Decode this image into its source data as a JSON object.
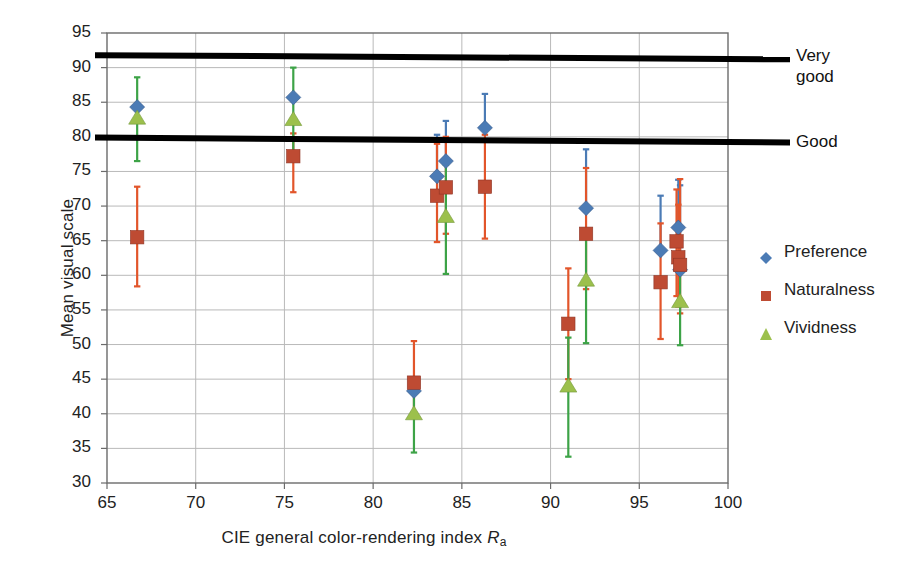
{
  "chart_data": {
    "type": "scatter",
    "title": "",
    "xlabel": "CIE general color-rendering index R_a",
    "xlabel_parts": {
      "main": "CIE general color-rendering index ",
      "italic": "R",
      "sub": "a"
    },
    "ylabel": "Mean visual scale",
    "xlim": [
      65,
      100
    ],
    "ylim": [
      30,
      95
    ],
    "xticks": [
      65,
      70,
      75,
      80,
      85,
      90,
      95,
      100
    ],
    "yticks": [
      30,
      35,
      40,
      45,
      50,
      55,
      60,
      65,
      70,
      75,
      80,
      85,
      90,
      95
    ],
    "grid": true,
    "legend_position": "right",
    "series": [
      {
        "name": "Preference",
        "marker": "diamond",
        "color": "#4B7BB5",
        "errorbar_color": "#4B7BB5",
        "points": [
          {
            "x": 66.7,
            "y": 84.3,
            "ylow": 84.3,
            "yhigh": 84.3
          },
          {
            "x": 75.5,
            "y": 85.7,
            "ylow": 85.7,
            "yhigh": 85.7
          },
          {
            "x": 82.3,
            "y": 43.3,
            "ylow": 43.3,
            "yhigh": 43.3
          },
          {
            "x": 83.6,
            "y": 74.3,
            "ylow": 74.3,
            "yhigh": 80.3
          },
          {
            "x": 84.1,
            "y": 76.5,
            "ylow": 76.5,
            "yhigh": 82.3
          },
          {
            "x": 86.3,
            "y": 81.3,
            "ylow": 81.3,
            "yhigh": 86.2
          },
          {
            "x": 92.0,
            "y": 69.7,
            "ylow": 69.7,
            "yhigh": 78.2
          },
          {
            "x": 96.2,
            "y": 63.6,
            "ylow": 63.6,
            "yhigh": 71.5
          },
          {
            "x": 97.2,
            "y": 66.9,
            "ylow": 66.9,
            "yhigh": 73.8
          },
          {
            "x": 97.3,
            "y": 60.8,
            "ylow": 60.8,
            "yhigh": 73.0
          }
        ]
      },
      {
        "name": "Naturalness",
        "marker": "square",
        "color": "#BE4B33",
        "errorbar_color": "#E2552A",
        "points": [
          {
            "x": 66.7,
            "y": 65.5,
            "ylow": 58.4,
            "yhigh": 72.8
          },
          {
            "x": 75.5,
            "y": 77.2,
            "ylow": 72.0,
            "yhigh": 80.5
          },
          {
            "x": 82.3,
            "y": 44.5,
            "ylow": 40.0,
            "yhigh": 50.5
          },
          {
            "x": 83.6,
            "y": 71.5,
            "ylow": 64.8,
            "yhigh": 79.0
          },
          {
            "x": 84.1,
            "y": 72.7,
            "ylow": 66.0,
            "yhigh": 80.0
          },
          {
            "x": 86.3,
            "y": 72.8,
            "ylow": 65.3,
            "yhigh": 80.3
          },
          {
            "x": 91.0,
            "y": 53.0,
            "ylow": 45.0,
            "yhigh": 61.0
          },
          {
            "x": 92.0,
            "y": 66.0,
            "ylow": 58.0,
            "yhigh": 75.5
          },
          {
            "x": 96.2,
            "y": 59.0,
            "ylow": 50.8,
            "yhigh": 67.5
          },
          {
            "x": 97.1,
            "y": 64.9,
            "ylow": 57.0,
            "yhigh": 72.4
          },
          {
            "x": 97.2,
            "y": 62.6,
            "ylow": 55.5,
            "yhigh": 70.2
          },
          {
            "x": 97.3,
            "y": 61.5,
            "ylow": 54.5,
            "yhigh": 73.9
          }
        ]
      },
      {
        "name": "Vividness",
        "marker": "triangle",
        "color": "#9CC04C",
        "errorbar_color": "#3DA347",
        "points": [
          {
            "x": 66.7,
            "y": 82.7,
            "ylow": 76.5,
            "yhigh": 88.6
          },
          {
            "x": 75.5,
            "y": 82.5,
            "ylow": 77.2,
            "yhigh": 90.0
          },
          {
            "x": 82.3,
            "y": 40.0,
            "ylow": 34.4,
            "yhigh": 45.0
          },
          {
            "x": 84.1,
            "y": 68.5,
            "ylow": 60.2,
            "yhigh": 76.0
          },
          {
            "x": 91.0,
            "y": 44.0,
            "ylow": 33.8,
            "yhigh": 51.0
          },
          {
            "x": 92.0,
            "y": 59.3,
            "ylow": 50.2,
            "yhigh": 66.0
          },
          {
            "x": 97.3,
            "y": 56.2,
            "ylow": 49.9,
            "yhigh": 63.0
          }
        ]
      }
    ],
    "reference_lines": [
      {
        "label": "Very\ngood",
        "y_left": 91.8,
        "y_right": 91.2
      },
      {
        "label": "Good",
        "y_left": 79.9,
        "y_right": 79.2
      }
    ]
  },
  "legend": {
    "items": [
      {
        "label": "Preference",
        "marker": "diamond",
        "color": "#4B7BB5"
      },
      {
        "label": "Naturalness",
        "marker": "square",
        "color": "#BE4B33"
      },
      {
        "label": "Vividness",
        "marker": "triangle",
        "color": "#9CC04C"
      }
    ]
  }
}
